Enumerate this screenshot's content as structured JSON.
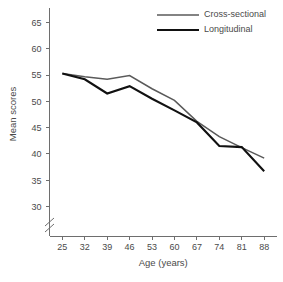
{
  "chart_data": {
    "type": "line",
    "title": "",
    "xlabel": "Age (years)",
    "ylabel": "Mean scores",
    "categories": [
      25,
      32,
      39,
      46,
      53,
      60,
      67,
      74,
      81,
      88
    ],
    "x": [
      25,
      32,
      39,
      46,
      53,
      60,
      67,
      74,
      81,
      88
    ],
    "xtick_labels": [
      "25",
      "32",
      "39",
      "46",
      "53",
      "60",
      "67",
      "74",
      "81",
      "88"
    ],
    "ytick_labels": [
      "30",
      "35",
      "40",
      "45",
      "50",
      "55",
      "60",
      "65"
    ],
    "yticks": [
      30,
      35,
      40,
      45,
      50,
      55,
      60,
      65
    ],
    "ylim": [
      28.2,
      67.0
    ],
    "xlim": [
      21.0,
      92.0
    ],
    "grid": false,
    "axis_break": true,
    "axis_break_axis": "y",
    "axis_break_below": 30,
    "legend_position": "top-right",
    "series": [
      {
        "name": "Cross-sectional",
        "color": "#5a5a5a",
        "width": 1.5,
        "values": [
          55.3,
          54.7,
          54.2,
          54.9,
          52.4,
          50.2,
          46.2,
          43.3,
          41.2,
          39.2
        ]
      },
      {
        "name": "Longitudinal",
        "color": "#111111",
        "width": 2.1,
        "values": [
          55.3,
          54.2,
          51.5,
          52.9,
          50.5,
          48.3,
          46.0,
          41.5,
          41.3,
          36.7
        ]
      }
    ]
  },
  "legend": {
    "items": [
      {
        "label": "Cross-sectional"
      },
      {
        "label": "Longitudinal"
      }
    ]
  },
  "axes": {
    "x_title": "Age (years)",
    "y_title": "Mean scores"
  },
  "colors": {
    "background": "#ffffff",
    "axis": "#6e6e6e",
    "text": "#4a4a4a",
    "cross_sectional": "#5a5a5a",
    "longitudinal": "#111111"
  }
}
